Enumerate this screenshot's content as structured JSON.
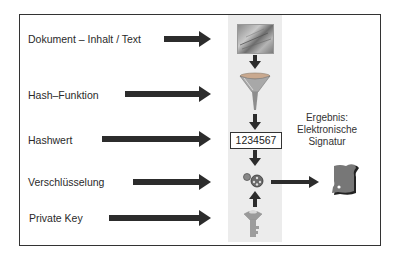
{
  "diagram": {
    "steps": [
      {
        "label": "Dokument – Inhalt / Text",
        "icon": "document-texture-icon"
      },
      {
        "label": "Hash–Funktion",
        "icon": "funnel-icon"
      },
      {
        "label": "Hashwert",
        "value": "1234567"
      },
      {
        "label": "Verschlüsselung",
        "icon": "gears-icon"
      },
      {
        "label": "Private Key",
        "icon": "key-icon"
      }
    ],
    "result": {
      "line1": "Ergebnis:",
      "line2": "Elektronische",
      "line3": "Signatur",
      "icon": "signature-card-icon"
    },
    "colors": {
      "arrow": "#2c2c2c",
      "frame": "#333333",
      "band": "#ececec"
    }
  }
}
